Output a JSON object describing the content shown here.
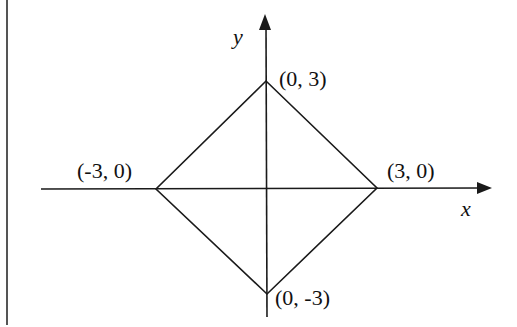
{
  "diagram": {
    "type": "coordinate-plane",
    "shape": "square (rotated 45°, diamond)",
    "axes": {
      "x_label": "x",
      "y_label": "y"
    },
    "vertices": {
      "top": {
        "label": "(0, 3)",
        "x": 0,
        "y": 3
      },
      "right": {
        "label": "(3, 0)",
        "x": 3,
        "y": 0
      },
      "bottom": {
        "label": "(0, -3)",
        "x": 0,
        "y": -3
      },
      "left": {
        "label": "(-3, 0)",
        "x": -3,
        "y": 0
      }
    },
    "colors": {
      "stroke": "#1a1a1a",
      "background": "#ffffff",
      "border": "#555555"
    }
  }
}
